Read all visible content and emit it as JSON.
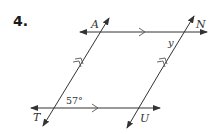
{
  "problem": {
    "number": "4."
  },
  "diagram": {
    "points": {
      "A": "A",
      "N": "N",
      "T": "T",
      "U": "U"
    },
    "angles": {
      "given": "57°",
      "unknown": "y"
    },
    "markings": {
      "horizontal_lines": "single-arrow parallel mark",
      "transversals": "double-arrow parallel mark"
    },
    "colors": {
      "line": "#333333",
      "text": "#333333",
      "number": "#1a1a1a",
      "background": "#ffffff"
    }
  }
}
